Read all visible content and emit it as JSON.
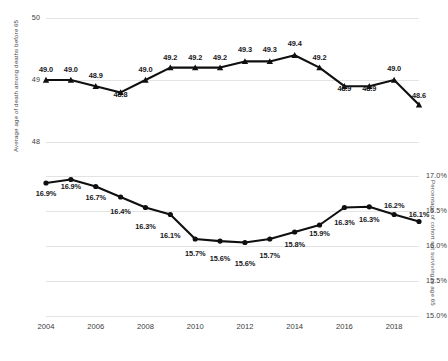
{
  "figure": {
    "background": "#ffffff",
    "line_color": "#0f0f0f",
    "grid_color": "#e3e3e3",
    "text_color": "#3b3b3b"
  },
  "chart_data": [
    {
      "type": "line",
      "panel": "top",
      "title": "",
      "xlabel": "",
      "ylabel": "Average age of death among deaths before 65",
      "x": [
        2004,
        2005,
        2006,
        2007,
        2008,
        2009,
        2010,
        2011,
        2012,
        2013,
        2014,
        2015,
        2016,
        2017,
        2018,
        2019
      ],
      "values": [
        49.0,
        49.0,
        48.9,
        48.8,
        49.0,
        49.2,
        49.2,
        49.2,
        49.3,
        49.3,
        49.4,
        49.2,
        48.9,
        48.9,
        49.0,
        48.6
      ],
      "point_labels": [
        "49.0",
        "49.0",
        "48.9",
        "48.8",
        "49.0",
        "49.2",
        "49.2",
        "49.2",
        "49.3",
        "49.3",
        "49.4",
        "49.2",
        "48.9",
        "48.9",
        "49.0",
        "48.6"
      ],
      "ylim": [
        48,
        50
      ],
      "yticks": [
        48,
        49,
        50
      ],
      "ytick_labels": [
        "48",
        "49",
        "50"
      ],
      "grid": true,
      "marker": "triangle",
      "legend": "none"
    },
    {
      "type": "line",
      "panel": "bottom",
      "title": "",
      "xlabel": "",
      "ylabel": "Percentage of cohort not surviving to age 65",
      "x": [
        2004,
        2005,
        2006,
        2007,
        2008,
        2009,
        2010,
        2011,
        2012,
        2013,
        2014,
        2015,
        2016,
        2017,
        2018,
        2019
      ],
      "values": [
        16.9,
        16.95,
        16.85,
        16.7,
        16.55,
        16.45,
        16.1,
        16.07,
        16.05,
        16.1,
        16.2,
        16.3,
        16.55,
        16.56,
        16.45,
        16.35
      ],
      "point_labels": [
        "16.9%",
        "16.9%",
        "16.7%",
        "16.4%",
        "16.3%",
        "16.1%",
        "15.7%",
        "15.6%",
        "15.6%",
        "15.7%",
        "15.8%",
        "15.9%",
        "16.3%",
        "16.3%",
        "16.2%",
        "16.1%"
      ],
      "ylim": [
        15.0,
        17.0
      ],
      "yticks": [
        15.0,
        15.5,
        16.0,
        16.5,
        17.0
      ],
      "ytick_labels": [
        "15.0%",
        "15.5%",
        "16.0%",
        "16.5%",
        "17.0%"
      ],
      "grid": true,
      "marker": "circle",
      "legend": "none"
    }
  ],
  "xaxis": {
    "tick_years": [
      2004,
      2006,
      2008,
      2010,
      2012,
      2014,
      2016,
      2018
    ],
    "tick_labels": [
      "2004",
      "2006",
      "2008",
      "2010",
      "2012",
      "2014",
      "2016",
      "2018"
    ]
  }
}
